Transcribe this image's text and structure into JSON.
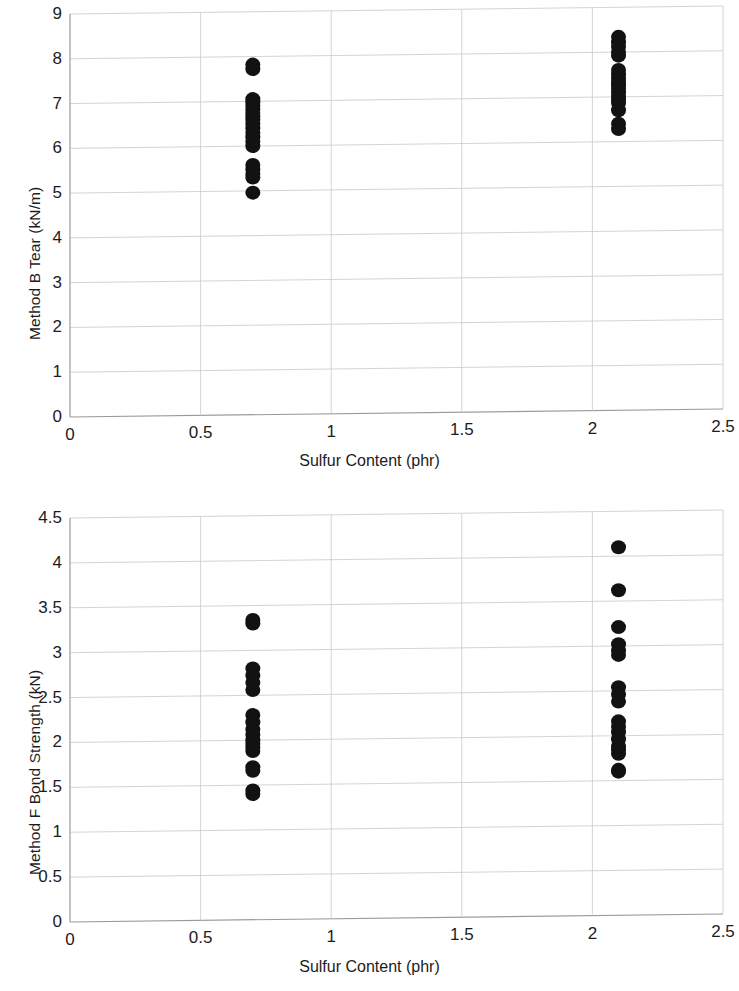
{
  "figure": {
    "background_color": "#ffffff",
    "marker_color": "#121212",
    "grid_color": "#c9c9c9",
    "axis_color": "#9a9a9a"
  },
  "charts": [
    {
      "id": "method-b-tear",
      "chart_data": {
        "type": "scatter",
        "title": "",
        "xlabel": "Sulfur Content (phr)",
        "ylabel": "Method B Tear (kN/m)",
        "xlim": [
          0,
          2.5
        ],
        "ylim": [
          0,
          9
        ],
        "xticks": [
          "0",
          "0.5",
          "1",
          "1.5",
          "2",
          "2.5"
        ],
        "xtick_values": [
          0,
          0.5,
          1,
          1.5,
          2,
          2.5
        ],
        "yticks": [
          "0",
          "1",
          "2",
          "3",
          "4",
          "5",
          "6",
          "7",
          "8",
          "9"
        ],
        "ytick_values": [
          0,
          1,
          2,
          3,
          4,
          5,
          6,
          7,
          8,
          9
        ],
        "grid": true,
        "legend": null,
        "series": [
          {
            "name": "Method B Tear",
            "x": [
              0.7,
              0.7,
              0.7,
              0.7,
              0.7,
              0.7,
              0.7,
              0.7,
              0.7,
              0.7,
              0.7,
              0.7,
              0.7,
              0.7,
              0.7,
              0.7,
              0.7,
              0.7,
              0.7,
              0.7,
              2.1,
              2.1,
              2.1,
              2.1,
              2.1,
              2.1,
              2.1,
              2.1,
              2.1,
              2.1,
              2.1,
              2.1,
              2.1,
              2.1,
              2.1,
              2.1,
              2.1,
              2.1
            ],
            "y": [
              7.82,
              7.72,
              7.05,
              6.98,
              6.9,
              6.82,
              6.74,
              6.66,
              6.58,
              6.5,
              6.4,
              6.3,
              6.2,
              6.1,
              6.0,
              5.58,
              5.48,
              5.38,
              5.3,
              4.96,
              8.34,
              8.22,
              8.12,
              8.0,
              7.92,
              7.6,
              7.5,
              7.42,
              7.34,
              7.26,
              7.18,
              7.1,
              7.02,
              6.94,
              6.86,
              6.7,
              6.4,
              6.28
            ]
          }
        ]
      }
    },
    {
      "id": "method-f-bond-strength",
      "chart_data": {
        "type": "scatter",
        "title": "",
        "xlabel": "Sulfur Content (phr)",
        "ylabel": "Method F Bond Strength (kN)",
        "xlim": [
          0,
          2.5
        ],
        "ylim": [
          0,
          4.5
        ],
        "xticks": [
          "0",
          "0.5",
          "1",
          "1.5",
          "2",
          "2.5"
        ],
        "xtick_values": [
          0,
          0.5,
          1,
          1.5,
          2,
          2.5
        ],
        "yticks": [
          "0",
          "0.5",
          "1",
          "1.5",
          "2",
          "2.5",
          "3",
          "3.5",
          "4",
          "4.5"
        ],
        "ytick_values": [
          0,
          0.5,
          1,
          1.5,
          2,
          2.5,
          3,
          3.5,
          4,
          4.5
        ],
        "grid": true,
        "legend": null,
        "series": [
          {
            "name": "Method F Bond Strength",
            "x": [
              0.7,
              0.7,
              0.7,
              0.7,
              0.7,
              0.7,
              0.7,
              0.7,
              0.7,
              0.7,
              0.7,
              0.7,
              0.7,
              0.7,
              0.7,
              0.7,
              0.7,
              0.7,
              2.1,
              2.1,
              2.1,
              2.1,
              2.1,
              2.1,
              2.1,
              2.1,
              2.1,
              2.1,
              2.1,
              2.1,
              2.1,
              2.1,
              2.1,
              2.1,
              2.1,
              2.1
            ],
            "y": [
              3.34,
              3.3,
              2.8,
              2.72,
              2.64,
              2.56,
              2.28,
              2.2,
              2.12,
              2.06,
              2.0,
              1.96,
              1.92,
              1.88,
              1.7,
              1.66,
              1.44,
              1.4,
              4.1,
              3.62,
              3.21,
              3.02,
              2.95,
              2.9,
              2.54,
              2.46,
              2.38,
              2.16,
              2.1,
              2.04,
              1.96,
              1.88,
              1.84,
              1.8,
              1.62,
              1.6
            ]
          }
        ]
      }
    }
  ]
}
